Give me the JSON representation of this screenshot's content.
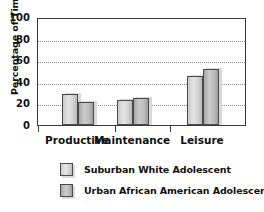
{
  "chart_data": {
    "type": "bar",
    "title": "",
    "xlabel": "",
    "ylabel": "Percentage of Time Spent",
    "ylim": [
      0,
      100
    ],
    "ytick_labels": [
      "100",
      "80",
      "60",
      "40",
      "20",
      "0"
    ],
    "ytick_values": [
      100,
      80,
      60,
      40,
      20,
      0
    ],
    "grid": "horizontal-dotted",
    "legend_position": "below",
    "categories": [
      "Productive",
      "Maintenance",
      "Leisure"
    ],
    "series": [
      {
        "name": "Suburban White Adolescent",
        "color": "#d4d4d4",
        "values": [
          29,
          23.5,
          45
        ]
      },
      {
        "name": "Urban African American Adolescent",
        "color": "#b0b0b0",
        "values": [
          21.5,
          25,
          52
        ]
      }
    ]
  },
  "axis": {
    "y_title": "Percentage of Time Spent"
  },
  "legend": {
    "items": [
      {
        "label": "Suburban White Adolescent"
      },
      {
        "label": "Urban African American Adolescent"
      }
    ]
  },
  "colors": {
    "frame": "#3b3b3b",
    "grid": "#8d8d8d",
    "bar_edge": "#4a4a4a",
    "text": "#111111",
    "background": "#ffffff"
  }
}
